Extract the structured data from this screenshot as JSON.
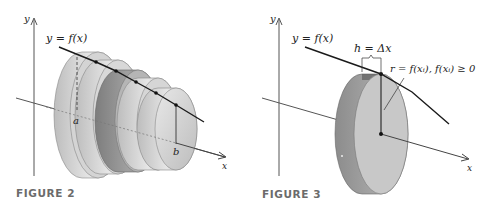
{
  "figures": [
    {
      "id": "figure-2",
      "caption": "FIGURE 2",
      "labels": {
        "y_axis": "y",
        "x_axis": "x",
        "curve": "y = f(x)",
        "a": "a",
        "b": "b"
      },
      "description": "Solid of revolution approximated by five stacked cylindrical disks between x=a and x=b under y=f(x)"
    },
    {
      "id": "figure-3",
      "caption": "FIGURE 3",
      "labels": {
        "y_axis": "y",
        "x_axis": "x",
        "curve": "y = f(x)",
        "height": "h = Δx",
        "radius": "r = f(xᵢ), f(xᵢ) ≥ 0"
      },
      "description": "A single cylindrical disk of height h = Δx and radius r = f(xᵢ)"
    }
  ],
  "colors": {
    "axis": "#555555",
    "curve": "#1a1a1a",
    "disk_light": "#d9d9d9",
    "disk_mid": "#a8a8a8",
    "disk_dark": "#7a7a7a",
    "caption": "#6b6b6b"
  }
}
